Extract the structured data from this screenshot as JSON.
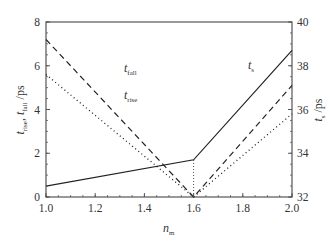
{
  "chart_data": {
    "type": "line",
    "title": "",
    "xlabel": "n_m",
    "ylabel": "t_rise, t_fall / ps",
    "y2label": "t_s / ps",
    "xlim": [
      1.0,
      2.0
    ],
    "ylim": [
      0,
      8
    ],
    "y2lim": [
      32,
      40
    ],
    "xticks": [
      "1.0",
      "1.2",
      "1.4",
      "1.6",
      "1.8",
      "2.0"
    ],
    "yticks": [
      "0",
      "2",
      "4",
      "6",
      "8"
    ],
    "y2ticks": [
      "32",
      "34",
      "36",
      "38",
      "40"
    ],
    "grid": false,
    "series": [
      {
        "name": "t_fall",
        "axis": "left",
        "style": "dashed",
        "x": [
          1.0,
          1.6,
          2.0
        ],
        "values": [
          7.2,
          0.0,
          5.1
        ]
      },
      {
        "name": "t_rise",
        "axis": "left",
        "style": "dotted",
        "x": [
          1.0,
          1.6,
          2.0
        ],
        "values": [
          5.6,
          0.0,
          3.8
        ]
      },
      {
        "name": "t_s",
        "axis": "right",
        "style": "solid",
        "x": [
          1.0,
          1.6,
          2.0
        ],
        "values": [
          32.5,
          33.7,
          38.7
        ]
      }
    ],
    "annotations": [
      {
        "text": "t_fall",
        "near": "dashed line",
        "x": 1.37,
        "y": 6.0
      },
      {
        "text": "t_rise",
        "near": "dotted line",
        "x": 1.37,
        "y": 4.9
      },
      {
        "text": "t_s",
        "near": "solid line",
        "x": 1.83,
        "y": 6.7
      },
      {
        "text": "vertical dotted marker",
        "x": 1.6
      }
    ]
  },
  "labels": {
    "x_main": "n",
    "x_sub": "m",
    "y_left_t1": "t",
    "y_left_sub1": "rise",
    "y_left_sep": ", ",
    "y_left_t2": "t",
    "y_left_sub2": "fall",
    "y_left_unit": " /ps",
    "y_right_t": "t",
    "y_right_sub": "s",
    "y_right_unit": " /ps",
    "ann_fall_t": "t",
    "ann_fall_sub": "fall",
    "ann_rise_t": "t",
    "ann_rise_sub": "rise",
    "ann_s_t": "t",
    "ann_s_sub": "s"
  },
  "colors": {
    "line": "#222222",
    "axis": "#555555"
  }
}
